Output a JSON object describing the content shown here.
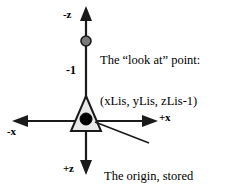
{
  "diagram": {
    "colors": {
      "stroke": "#1a1a1a",
      "text": "#000000",
      "triangle_fill": "#e9e9e9",
      "origin_dot": "#000000",
      "lookat_dot": "#7a7a7a",
      "background": "#ffffff"
    },
    "axes": [
      {
        "id": "neg-z",
        "label": "-z",
        "direction": "up"
      },
      {
        "id": "pos-z",
        "label": "+z",
        "direction": "down"
      },
      {
        "id": "neg-x",
        "label": "-x",
        "direction": "left"
      },
      {
        "id": "pos-x",
        "label": "+x",
        "direction": "right"
      }
    ],
    "ticks": [
      {
        "id": "minus-one",
        "label": "-1",
        "axis": "neg-z"
      }
    ],
    "annotations": {
      "lookat": {
        "line1": "The “look at” point:",
        "line2": "(xLis, yLis, zLis-1)"
      },
      "origin": {
        "line1": "The origin, stored",
        "line2": "in (xLis, yLis, zLis)"
      }
    },
    "markers": [
      {
        "id": "lookat-point",
        "name": "look-at-point-marker"
      },
      {
        "id": "origin-point",
        "name": "origin-point-marker"
      }
    ],
    "shapes": [
      {
        "id": "camera-triangle",
        "name": "camera-triangle"
      }
    ]
  }
}
